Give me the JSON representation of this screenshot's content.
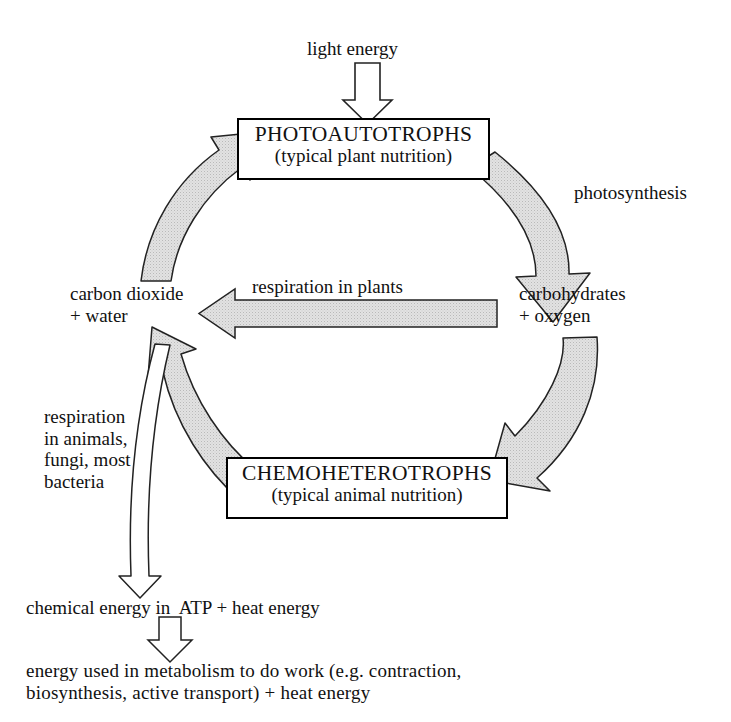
{
  "diagram": {
    "background": "#ffffff",
    "ink": "#000000",
    "arrow_fill": "#dedede"
  },
  "boxes": [
    {
      "id": "photoautotrophs",
      "heading": "PHOTOAUTOTROPHS",
      "subheading": "(typical plant nutrition)"
    },
    {
      "id": "chemoheterotrophs",
      "heading": "CHEMOHETEROTROPHS",
      "subheading": "(typical animal nutrition)"
    }
  ],
  "labels": {
    "light_energy": "light energy",
    "photosynthesis": "photosynthesis",
    "carbon_dioxide": "carbon dioxide\n+ water",
    "respiration_in_plants": "respiration in plants",
    "carbohydrates": "carbohydrates\n+ oxygen",
    "respiration_in_animals": "respiration\nin animals,\nfungi, most\nbacteria",
    "chemical_energy": "chemical energy in  ATP + heat energy",
    "energy_used": "energy used in metabolism to do work (e.g. contraction,\nbiosynthesis, active transport) + heat energy"
  },
  "arrows": [
    {
      "id": "light-energy-arrow",
      "style": "hollow",
      "direction": "down",
      "from": "light energy",
      "to": "PHOTOAUTOTROPHS"
    },
    {
      "id": "photosynthesis-arrow",
      "style": "shaded",
      "direction": "curve-down-right",
      "from": "PHOTOAUTOTROPHS",
      "to": "carbohydrates + oxygen"
    },
    {
      "id": "carbohydrates-to-chemoheterotrophs-arrow",
      "style": "shaded",
      "direction": "curve-down-left",
      "from": "carbohydrates + oxygen",
      "to": "CHEMOHETEROTROPHS"
    },
    {
      "id": "respiration-in-plants-arrow",
      "style": "shaded",
      "direction": "left",
      "from": "carbohydrates + oxygen",
      "to": "carbon dioxide + water"
    },
    {
      "id": "respiration-in-animals-arrow",
      "style": "shaded",
      "direction": "curve-up-left",
      "from": "CHEMOHETEROTROPHS",
      "to": "carbon dioxide + water"
    },
    {
      "id": "carbon-dioxide-to-photoautotrophs-arrow",
      "style": "shaded",
      "direction": "curve-up-right",
      "from": "carbon dioxide + water",
      "to": "PHOTOAUTOTROPHS"
    },
    {
      "id": "chemical-energy-arrow",
      "style": "hollow",
      "direction": "curve-down-left",
      "from": "CHEMOHETEROTROPHS",
      "to": "chemical energy in ATP + heat energy"
    },
    {
      "id": "energy-used-arrow",
      "style": "hollow",
      "direction": "down",
      "from": "chemical energy in ATP + heat energy",
      "to": "energy used in metabolism"
    }
  ]
}
